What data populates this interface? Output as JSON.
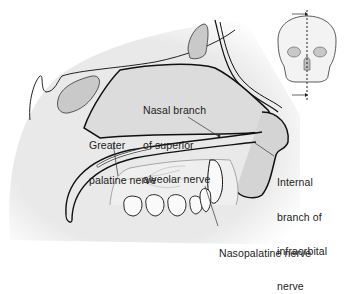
{
  "diagram": {
    "type": "anatomical sagittal section",
    "labels": [
      {
        "id": "nasal-branch-superior-alveolar",
        "lines": [
          "Nasal branch",
          "of superior",
          "alveolar nerve"
        ]
      },
      {
        "id": "greater-palatine",
        "lines": [
          "Greater",
          "palatine nerve"
        ]
      },
      {
        "id": "internal-branch-infraorbital",
        "lines": [
          "Internal",
          "branch of",
          "infraorbital",
          "nerve"
        ]
      },
      {
        "id": "nasopalatine",
        "lines": [
          "Nasopalatine nerve"
        ]
      }
    ],
    "inset": {
      "subject": "skull frontal view",
      "indicator": "dashed midsagittal section line with arrows"
    },
    "colors": {
      "bone_fill": "#ececec",
      "cavity_fill": "#d9d9d9",
      "sinus_fill": "#c6c6c6",
      "outline": "#1a1a1a",
      "text": "#222222"
    }
  }
}
